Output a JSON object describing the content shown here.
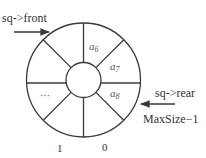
{
  "diagram": {
    "pointers": {
      "front": {
        "label": "sq->front"
      },
      "rear": {
        "label": "sq->rear"
      }
    },
    "index_labels": {
      "max": "MaxSize−1",
      "one": "1",
      "zero": "0"
    },
    "slots": [
      {
        "position": "top-right",
        "base": "a",
        "sub": "6"
      },
      {
        "position": "right-upper",
        "base": "a",
        "sub": "7"
      },
      {
        "position": "right-lower",
        "base": "a",
        "sub": "8"
      },
      {
        "position": "bottom-right",
        "base": "",
        "sub": ""
      },
      {
        "position": "bottom-left",
        "base": "",
        "sub": ""
      },
      {
        "position": "left-lower",
        "base": "···",
        "sub": ""
      },
      {
        "position": "left-upper",
        "base": "",
        "sub": ""
      },
      {
        "position": "top-left",
        "base": "",
        "sub": ""
      }
    ],
    "colors": {
      "line": "#3a3a3a",
      "text": "#333333"
    }
  }
}
